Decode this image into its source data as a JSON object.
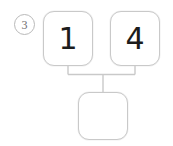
{
  "problem": {
    "number_label": "3",
    "type": "number-bond-addition",
    "addends": [
      {
        "value": "1"
      },
      {
        "value": "4"
      }
    ],
    "sum": {
      "value": "",
      "is_blank": true
    }
  },
  "colors": {
    "box_border": "#c9c9c9",
    "circle_border": "#b9b9b9",
    "connector_line": "#c9c9c9",
    "digit_text": "#1c1c1c",
    "number_label_text": "#6d6d6d",
    "background": "#ffffff"
  },
  "icons": {
    "problem_number_circle": "circle-outline-icon",
    "connector": "bracket-connector-icon"
  }
}
